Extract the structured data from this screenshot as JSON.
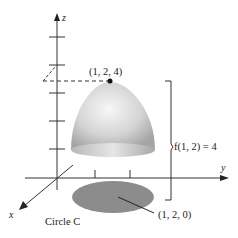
{
  "figure": {
    "axes": {
      "z_label": "z",
      "y_label": "y",
      "x_label": "x"
    },
    "top_point_label": "(1, 2, 4)",
    "height_label": "f(1, 2) = 4",
    "base_point_label": "(1, 2, 0)",
    "region_label": "Circle C",
    "colors": {
      "axis": "#333333",
      "surface_light": "#f2f2f2",
      "surface_dark": "#a8a8a8",
      "region_fill": "#8c8c8c"
    }
  }
}
